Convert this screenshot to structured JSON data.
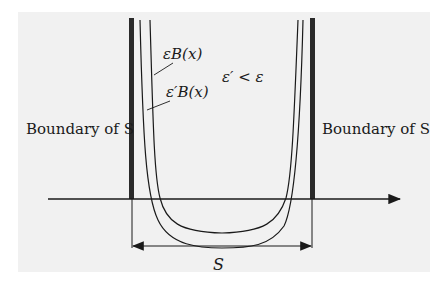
{
  "diagram": {
    "labels": {
      "boundary_left": "Boundary of S",
      "boundary_right": "Boundary of S",
      "curve_outer": "εB(x)",
      "curve_inner": "ε′B(x)",
      "relation": "ε′ < ε",
      "set": "S"
    },
    "colors": {
      "background": "#f1f1f1",
      "ink": "#1a1a1a",
      "boundary_bar": "#2a2a2a"
    }
  }
}
